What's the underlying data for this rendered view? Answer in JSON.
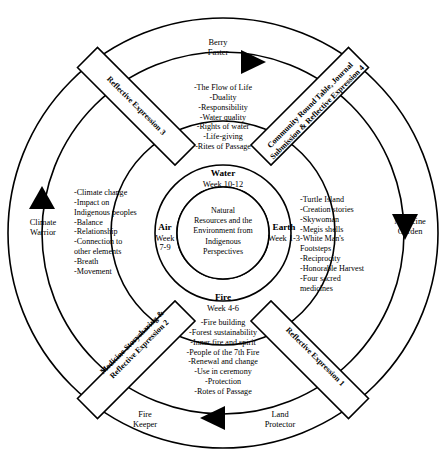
{
  "diagram": {
    "center": {
      "text": "Natural\nResources and the\nEnvironment from\nIndigenous\nPerspectives"
    },
    "quadrants": [
      {
        "id": "water",
        "element": "Water",
        "weeks": "Week 10-12",
        "position": "top",
        "items": [
          "-The Flow of Life",
          "-Duality",
          "-Responsibility",
          "-Water quality",
          "-Rights of water",
          "-Life-giving",
          "-Rites of Passage"
        ],
        "items_text": "-The Flow of Life\n-Duality\n-Responsibility\n-Water quality\n-Rights of water\n-Life-giving\n-Rites of Passage"
      },
      {
        "id": "earth",
        "element": "Earth",
        "weeks": "Week 1-3",
        "position": "right",
        "items": [
          "-Turtle Island",
          "-Creation stories",
          "-Skywoman",
          "-Megis shells",
          "-White Man's Footsteps",
          "-Reciprocity",
          "-Honorable Harvest",
          "-Four sacred medicines"
        ],
        "items_text": "-Turtle Island\n-Creation stories\n-Skywoman\n-Megis shells\n-White Man's\n  Footsteps\n-Reciprocity\n-Honorable Harvest\n-Four sacred\n  medicines"
      },
      {
        "id": "fire",
        "element": "Fire",
        "weeks": "Week 4-6",
        "position": "bottom",
        "items": [
          "-Fire building",
          "-Forest sustainability",
          "-Inner fire and spirit",
          "-People of the 7th Fire",
          "-Renewal and change",
          "-Use in ceremony",
          "-Protection",
          "-Rotes of Passage"
        ],
        "items_text": "-Fire building\n-Forest sustainability\n-Inner fire and spirit\n-People of the 7th Fire\n-Renewal and change\n-Use in ceremony\n-Protection\n-Rotes of Passage"
      },
      {
        "id": "air",
        "element": "Air",
        "weeks": "Week\n7-9",
        "weeks_line1": "Week",
        "weeks_line2": "7-9",
        "position": "left",
        "items": [
          "-Climate change",
          "-Impact on Indigenous peoples",
          "-Balance",
          "-Relationship",
          "-Connection to other elements",
          "-Breath",
          "-Movement"
        ],
        "items_text": "-Climate change\n-Impact on\n  Indigenous peoples\n-Balance\n-Relationship\n-Connection to\n  other elements\n-Breath\n-Movement"
      }
    ],
    "bands": [
      {
        "id": "reflective-expression-3",
        "label": "Reflective Expression 3",
        "position": "top-left"
      },
      {
        "id": "community-round-table-reflective-expression-4",
        "label": "Community Round Table, Journal\nSubmission & Reflective Expression 4",
        "position": "top-right"
      },
      {
        "id": "reflective-expression-1",
        "label": "Reflective Expression 1",
        "position": "bottom-right"
      },
      {
        "id": "medicine-storysharing-reflective-expression-2",
        "label": "Medicine Storysharing &\nReflective Expression 2",
        "position": "bottom-left"
      }
    ],
    "outer_roles": [
      {
        "id": "berry-faster",
        "label": "Berry\nFaster",
        "position": "top",
        "marker": "triangle-right"
      },
      {
        "id": "medicine-garden",
        "label": "Medicine\nGarden",
        "position": "right",
        "marker": "triangle-down"
      },
      {
        "id": "land-protector",
        "label": "Land\nProtector",
        "position": "bottom-right",
        "marker": "triangle-left"
      },
      {
        "id": "fire-keeper",
        "label": "Fire\nKeeper",
        "position": "bottom-left",
        "marker": "triangle-left"
      },
      {
        "id": "climate-warrior",
        "label": "Climate\nWarrior",
        "position": "left",
        "marker": "triangle-up"
      }
    ],
    "colors": {
      "stroke": "#000000",
      "background": "#ffffff",
      "marker": "#000000"
    }
  }
}
